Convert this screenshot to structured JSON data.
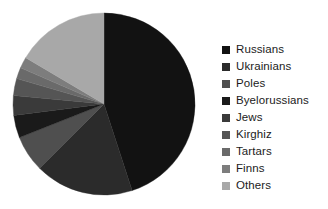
{
  "chart_data": {
    "type": "pie",
    "title": "",
    "subtitle": "",
    "xlabel": "",
    "ylabel": "",
    "grid": false,
    "legend_position": "right",
    "start_angle_deg": 0,
    "direction": "clockwise",
    "categories": [
      "Russians",
      "Ukrainians",
      "Poles",
      "Byelorussians",
      "Jews",
      "Kirghiz",
      "Tartars",
      "Finns",
      "Others"
    ],
    "values": [
      45,
      17.5,
      6.5,
      4,
      3.5,
      3,
      2,
      2,
      16.5
    ],
    "colors": [
      "#121212",
      "#2b2b2b",
      "#4f4f4f",
      "#1a1a1a",
      "#3a3a3a",
      "#555555",
      "#6a6a6a",
      "#7d7d7d",
      "#a8a8a8"
    ],
    "geometry": {
      "center_x": 104,
      "center_y": 104,
      "radius": 91
    }
  },
  "legend": {
    "items": [
      {
        "label": "Russians",
        "color": "#121212"
      },
      {
        "label": "Ukrainians",
        "color": "#2b2b2b"
      },
      {
        "label": "Poles",
        "color": "#4f4f4f"
      },
      {
        "label": "Byelorussians",
        "color": "#1a1a1a"
      },
      {
        "label": "Jews",
        "color": "#3a3a3a"
      },
      {
        "label": "Kirghiz",
        "color": "#555555"
      },
      {
        "label": "Tartars",
        "color": "#6a6a6a"
      },
      {
        "label": "Finns",
        "color": "#7d7d7d"
      },
      {
        "label": "Others",
        "color": "#a8a8a8"
      }
    ]
  }
}
